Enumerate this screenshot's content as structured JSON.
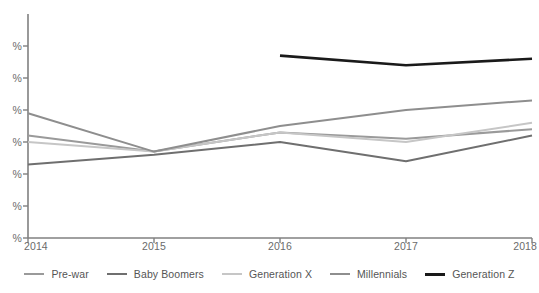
{
  "chart_data": {
    "type": "line",
    "title": "",
    "xlabel": "",
    "ylabel": "",
    "categories": [
      "2014",
      "2015",
      "2016",
      "2017",
      "2018"
    ],
    "x_tick_labels": [
      "2014",
      "2015",
      "2016",
      "2017",
      "2018"
    ],
    "y_tick_labels": [
      "%",
      "%",
      "%",
      "%",
      "%",
      "%",
      "%"
    ],
    "y_tick_note": "Y-axis numeric values are cropped off the left edge of the screenshot; only the percent signs are visible.",
    "ylim": [
      0,
      70
    ],
    "y_ticks": [
      0,
      10,
      20,
      30,
      40,
      50,
      60
    ],
    "grid": false,
    "legend_position": "bottom",
    "series": [
      {
        "name": "Pre-war",
        "color": "#9a9a9a",
        "width": 2.0,
        "x": [
          "2014",
          "2015",
          "2016",
          "2017",
          "2018"
        ],
        "values": [
          32,
          27,
          33,
          31,
          34
        ]
      },
      {
        "name": "Baby Boomers",
        "color": "#6f6f6f",
        "width": 2.0,
        "x": [
          "2014",
          "2015",
          "2016",
          "2017",
          "2018"
        ],
        "values": [
          23,
          26,
          30,
          24,
          32
        ]
      },
      {
        "name": "Generation X",
        "color": "#c6c6c6",
        "width": 2.0,
        "x": [
          "2014",
          "2015",
          "2016",
          "2017",
          "2018"
        ],
        "values": [
          30,
          27,
          33,
          30,
          36
        ]
      },
      {
        "name": "Millennials",
        "color": "#8e8e8e",
        "width": 2.0,
        "x": [
          "2014",
          "2015",
          "2016",
          "2017",
          "2018"
        ],
        "values": [
          39,
          27,
          35,
          40,
          43
        ]
      },
      {
        "name": "Generation Z",
        "color": "#1a1a1a",
        "width": 2.6,
        "x": [
          "2016",
          "2017",
          "2018"
        ],
        "values": [
          57,
          54,
          56
        ]
      }
    ]
  },
  "axis": {
    "line_color": "#808080",
    "tick_color": "#808080"
  },
  "legend": {
    "items": [
      {
        "label": "Pre-war",
        "color": "#9a9a9a",
        "width": "2px"
      },
      {
        "label": "Baby Boomers",
        "color": "#6f6f6f",
        "width": "2.4px"
      },
      {
        "label": "Generation X",
        "color": "#c6c6c6",
        "width": "2px"
      },
      {
        "label": "Millennials",
        "color": "#8e8e8e",
        "width": "2.2px"
      },
      {
        "label": "Generation Z",
        "color": "#1a1a1a",
        "width": "3px"
      }
    ]
  }
}
